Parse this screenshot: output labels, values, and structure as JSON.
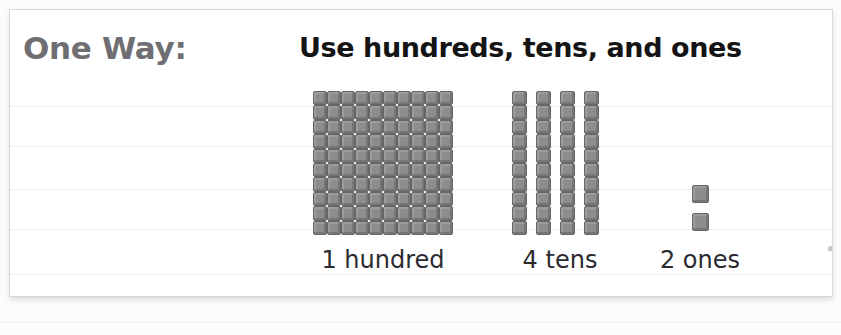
{
  "card": {
    "one_way_label": "One Way:",
    "method_title": "Use hundreds, tens, and ones"
  },
  "groups": [
    {
      "id": "hundreds",
      "caption": "1 hundred",
      "block_kind": "hundreds-flat",
      "count": 1,
      "unit_cubes": 100,
      "rows": 10,
      "cols": 10,
      "left": 303,
      "caption_left": 303,
      "caption_width": 140
    },
    {
      "id": "tens",
      "caption": "4 tens",
      "block_kind": "tens-rod",
      "count": 4,
      "unit_cubes": 40,
      "rows": 10,
      "cols": 1,
      "left": 502,
      "caption_left": 490,
      "caption_width": 120
    },
    {
      "id": "ones",
      "caption": "2 ones",
      "block_kind": "unit-cube",
      "count": 2,
      "unit_cubes": 2,
      "rows": 2,
      "cols": 1,
      "left": 682,
      "caption_left": 630,
      "caption_width": 120
    }
  ],
  "represented_number": 142,
  "colors": {
    "block_face": "#8d8d8d",
    "block_edge": "#666668",
    "block_highlight": "#aaaaac",
    "block_shadow": "#5a5a5c",
    "heading_gray": "#6e6e73",
    "title_black": "#141414",
    "caption_text": "#2b2b2f",
    "card_background": "#ffffff",
    "card_border": "#d8d8dc",
    "rule_line": "#ececf1",
    "page_background": "#fcfcfc"
  },
  "rules": {
    "card_rule_offsets": [
      96,
      136,
      179,
      219,
      264
    ],
    "page_rule_offsets": [
      322
    ]
  }
}
